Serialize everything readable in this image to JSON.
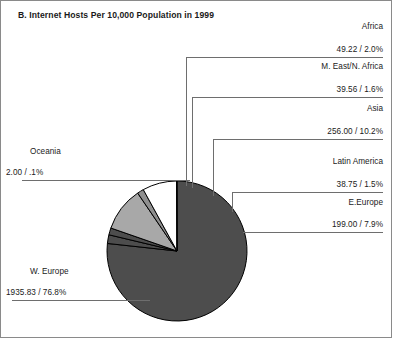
{
  "chart_data": {
    "type": "pie",
    "title": "B. Internet Hosts Per 10,000 Population in 1999",
    "xlabel": "",
    "ylabel": "",
    "legend_position": "callout-labels",
    "grid": false,
    "value_label_format": "value / percent",
    "categories": [
      "W. Europe",
      "Africa",
      "M. East/N. Africa",
      "Asia",
      "Latin America",
      "E.Europe",
      "Oceania"
    ],
    "values": [
      1935.83,
      49.22,
      39.56,
      256.0,
      38.75,
      199.0,
      2.0
    ],
    "percents": [
      76.8,
      2.0,
      1.6,
      10.2,
      1.5,
      7.9,
      0.1
    ],
    "slices": [
      {
        "name": "W. Europe",
        "value": 1935.83,
        "value_text": "1935.83",
        "percent": 76.8,
        "percent_text": "76.8%",
        "label_text": "1935.83 / 76.8%",
        "color": "#4d4d4d"
      },
      {
        "name": "Africa",
        "value": 49.22,
        "value_text": "49.22",
        "percent": 2.0,
        "percent_text": "2.0%",
        "label_text": "49.22 / 2.0%",
        "color": "#4d4d4d"
      },
      {
        "name": "M. East/N. Africa",
        "value": 39.56,
        "value_text": "39.56",
        "percent": 1.6,
        "percent_text": "1.6%",
        "label_text": "39.56 / 1.6%",
        "color": "#4d4d4d"
      },
      {
        "name": "Asia",
        "value": 256.0,
        "value_text": "256.00",
        "percent": 10.2,
        "percent_text": "10.2%",
        "label_text": "256.00 / 10.2%",
        "color": "#a8a8a8"
      },
      {
        "name": "Latin America",
        "value": 38.75,
        "value_text": "38.75",
        "percent": 1.5,
        "percent_text": "1.5%",
        "label_text": "38.75 / 1.5%",
        "color": "#8f8f8f"
      },
      {
        "name": "E.Europe",
        "value": 199.0,
        "value_text": "199.00",
        "percent": 7.9,
        "percent_text": "7.9%",
        "label_text": "199.00 / 7.9%",
        "color": "#ffffff"
      },
      {
        "name": "Oceania",
        "value": 2.0,
        "value_text": "2.00",
        "percent": 0.1,
        "percent_text": ".1%",
        "label_text": "2.00 / .1%",
        "color": "#4d4d4d"
      }
    ]
  },
  "labels": {
    "africa_name": "Africa",
    "africa_value": "49.22 / 2.0%",
    "meast_name": "M. East/N. Africa",
    "meast_value": "39.56 / 1.6%",
    "asia_name": "Asia",
    "asia_value": "256.00 / 10.2%",
    "latin_name": "Latin America",
    "latin_value": "38.75 / 1.5%",
    "eeurope_name": "E.Europe",
    "eeurope_value": "199.00 / 7.9%",
    "oceania_name": "Oceania",
    "oceania_value": "2.00 / .1%",
    "weurope_name": "W. Europe",
    "weurope_value": "1935.83 / 76.8%"
  },
  "style": {
    "frame_color": "#8a8a8a",
    "leader_color": "#6e6e6e",
    "outline_color": "#000000",
    "background": "#ffffff"
  }
}
